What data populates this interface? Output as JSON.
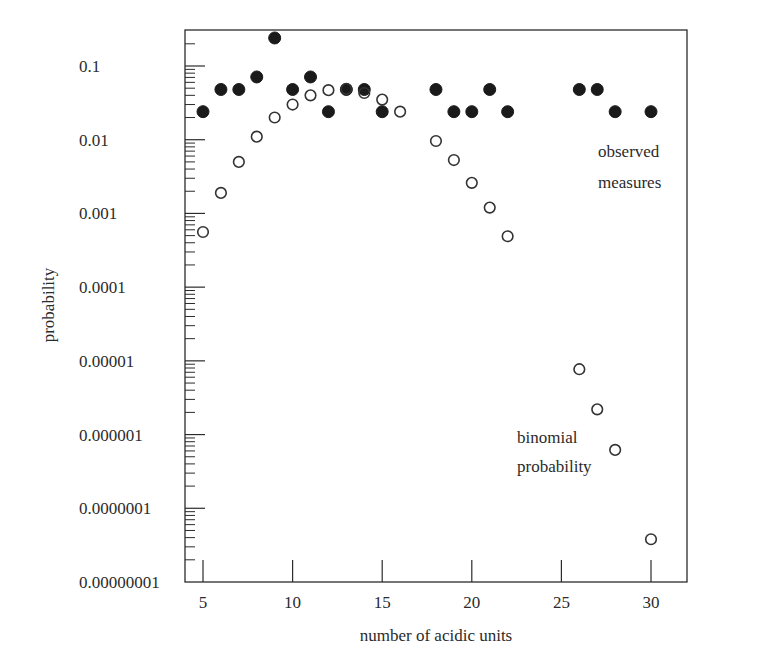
{
  "chart_data": {
    "type": "scatter",
    "title": "",
    "xlabel": "number of acidic units",
    "ylabel": "probability",
    "yscale": "log",
    "xlim": [
      4,
      32
    ],
    "ylim": [
      1e-08,
      0.31
    ],
    "grid": false,
    "legend": "inline annotations",
    "x_ticks": [
      5,
      10,
      15,
      20,
      25,
      30
    ],
    "x_tick_labels": [
      "5",
      "10",
      "15",
      "20",
      "25",
      "30"
    ],
    "y_ticks": [
      0.1,
      0.01,
      0.001,
      0.0001,
      1e-05,
      1e-06,
      1e-07,
      1e-08
    ],
    "y_tick_labels": [
      "0.1",
      "0.01",
      "0.001",
      "0.0001",
      "0.00001",
      "0.000001",
      "0.0000001",
      "0.00000001"
    ],
    "series": [
      {
        "name": "observed measures",
        "marker": "filled-circle",
        "color": "#1a1a1a",
        "x": [
          5,
          6,
          7,
          8,
          9,
          10,
          11,
          12,
          13,
          14,
          15,
          18,
          19,
          20,
          21,
          22,
          26,
          27,
          28,
          30
        ],
        "y": [
          0.024,
          0.048,
          0.048,
          0.071,
          0.24,
          0.048,
          0.071,
          0.024,
          0.048,
          0.048,
          0.024,
          0.048,
          0.024,
          0.024,
          0.048,
          0.024,
          0.048,
          0.048,
          0.024,
          0.024
        ]
      },
      {
        "name": "binomial probability",
        "marker": "open-circle",
        "color": "#1a1a1a",
        "x": [
          5,
          6,
          7,
          8,
          9,
          10,
          11,
          12,
          13,
          14,
          15,
          16,
          18,
          19,
          20,
          21,
          22,
          26,
          27,
          28,
          30
        ],
        "y": [
          0.00056,
          0.0019,
          0.005,
          0.011,
          0.02,
          0.03,
          0.04,
          0.047,
          0.049,
          0.043,
          0.035,
          0.024,
          0.0096,
          0.0053,
          0.0026,
          0.0012,
          0.00049,
          7.7e-06,
          2.2e-06,
          6.2e-07,
          3.8e-08
        ]
      }
    ],
    "annotations": [
      {
        "lines": [
          "observed",
          "measures"
        ],
        "x_px": 598,
        "y_px": 157
      },
      {
        "lines": [
          "binomial",
          "probability"
        ],
        "x_px": 517,
        "y_px": 443
      }
    ]
  },
  "labels": {
    "xlabel": "number of acidic units",
    "ylabel": "probability",
    "observed_line1": "observed",
    "observed_line2": "measures",
    "binomial_line1": "binomial",
    "binomial_line2": "probability"
  }
}
